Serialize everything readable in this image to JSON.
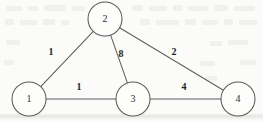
{
  "figure": {
    "title": "",
    "background_color": "#fbfbfa",
    "stroke_color": "#5a5a5a",
    "label_color": "#1f1f1f"
  },
  "chart_data": {
    "type": "diagram",
    "diagram_kind": "weighted-undirected-graph",
    "title": "",
    "xlabel": "",
    "ylabel": "",
    "grid": false,
    "legend": null,
    "nodes": [
      {
        "id": "1",
        "label": "1",
        "cx": 29,
        "cy": 99,
        "r": 17
      },
      {
        "id": "2",
        "label": "2",
        "cx": 105,
        "cy": 19,
        "r": 17
      },
      {
        "id": "3",
        "label": "3",
        "cx": 133,
        "cy": 99,
        "r": 17
      },
      {
        "id": "4",
        "label": "4",
        "cx": 238,
        "cy": 99,
        "r": 17
      }
    ],
    "edges": [
      {
        "source": "1",
        "target": "2",
        "weight": 1,
        "label": "1",
        "lx": 51,
        "ly": 53
      },
      {
        "source": "2",
        "target": "3",
        "weight": 8,
        "label": "8",
        "lx": 121,
        "ly": 55
      },
      {
        "source": "2",
        "target": "4",
        "weight": 2,
        "label": "2",
        "lx": 174,
        "ly": 53
      },
      {
        "source": "1",
        "target": "3",
        "weight": 1,
        "label": "1",
        "lx": 79,
        "ly": 88
      },
      {
        "source": "3",
        "target": "4",
        "weight": 4,
        "label": "4",
        "lx": 184,
        "ly": 88
      }
    ]
  },
  "artifacts": {
    "ghost_marks": [
      {
        "x": 6,
        "y": 6,
        "w": 16,
        "h": 5
      },
      {
        "x": 28,
        "y": 6,
        "w": 10,
        "h": 5
      },
      {
        "x": 44,
        "y": 5,
        "w": 22,
        "h": 6
      },
      {
        "x": 72,
        "y": 6,
        "w": 13,
        "h": 5
      },
      {
        "x": 132,
        "y": 5,
        "w": 11,
        "h": 6
      },
      {
        "x": 149,
        "y": 6,
        "w": 18,
        "h": 5
      },
      {
        "x": 173,
        "y": 5,
        "w": 9,
        "h": 6
      },
      {
        "x": 188,
        "y": 6,
        "w": 20,
        "h": 5
      },
      {
        "x": 214,
        "y": 5,
        "w": 14,
        "h": 6
      },
      {
        "x": 234,
        "y": 6,
        "w": 21,
        "h": 5
      },
      {
        "x": 5,
        "y": 19,
        "w": 9,
        "h": 6
      },
      {
        "x": 20,
        "y": 20,
        "w": 17,
        "h": 5
      },
      {
        "x": 43,
        "y": 19,
        "w": 12,
        "h": 6
      },
      {
        "x": 61,
        "y": 20,
        "w": 8,
        "h": 5
      },
      {
        "x": 140,
        "y": 19,
        "w": 10,
        "h": 6
      },
      {
        "x": 156,
        "y": 20,
        "w": 23,
        "h": 5
      },
      {
        "x": 185,
        "y": 19,
        "w": 11,
        "h": 6
      },
      {
        "x": 202,
        "y": 20,
        "w": 16,
        "h": 5
      },
      {
        "x": 224,
        "y": 19,
        "w": 9,
        "h": 6
      },
      {
        "x": 239,
        "y": 20,
        "w": 18,
        "h": 5
      },
      {
        "x": 6,
        "y": 40,
        "w": 14,
        "h": 5
      },
      {
        "x": 210,
        "y": 41,
        "w": 12,
        "h": 5
      },
      {
        "x": 228,
        "y": 40,
        "w": 20,
        "h": 5
      },
      {
        "x": 4,
        "y": 60,
        "w": 10,
        "h": 5
      },
      {
        "x": 200,
        "y": 61,
        "w": 15,
        "h": 5
      },
      {
        "x": 240,
        "y": 60,
        "w": 16,
        "h": 5
      },
      {
        "x": 205,
        "y": 76,
        "w": 12,
        "h": 5
      }
    ],
    "ghost_bands": [
      {
        "y": 113,
        "h": 7
      }
    ]
  }
}
